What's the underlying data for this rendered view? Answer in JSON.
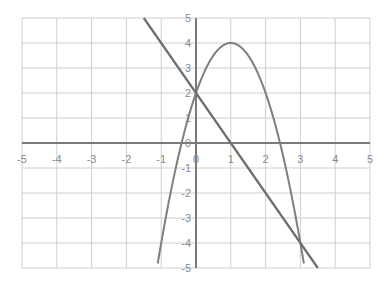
{
  "chart_data": {
    "type": "line",
    "title": "",
    "xlabel": "",
    "ylabel": "",
    "xlim": [
      -5,
      5
    ],
    "ylim": [
      -5,
      5
    ],
    "grid": true,
    "legend": null,
    "x_ticks": [
      "-5",
      "-4",
      "-3",
      "-2",
      "-1",
      "0",
      "1",
      "2",
      "3",
      "4",
      "5"
    ],
    "y_ticks": [
      "5",
      "4",
      "3",
      "2",
      "1",
      "0",
      "-1",
      "-2",
      "-3",
      "-4",
      "-5"
    ],
    "series": [
      {
        "name": "parabola",
        "equation": "y = -2x^2 + 4x + 2",
        "x": [
          -1.1,
          -1,
          -0.5,
          0,
          0.5,
          1,
          1.5,
          2,
          2.5,
          3,
          3.1
        ],
        "y": [
          -4.82,
          -4,
          -0.5,
          2,
          3.5,
          4,
          3.5,
          2,
          -0.5,
          -4,
          -4.82
        ]
      },
      {
        "name": "line",
        "equation": "y = -2x + 2",
        "x": [
          -1.5,
          3.5
        ],
        "y": [
          5,
          -5
        ]
      }
    ],
    "intersections": [
      [
        0,
        2
      ],
      [
        3,
        -4
      ]
    ],
    "colors": {
      "grid": "#cfcfcf",
      "axis": "#7a7a7a",
      "curve": "#7f7f7f",
      "line": "#6e6e6e",
      "tick_text": "#8a8a8a"
    }
  }
}
